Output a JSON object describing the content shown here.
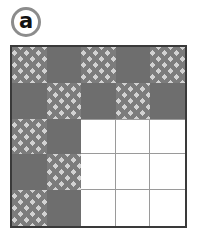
{
  "panel": {
    "label": "a",
    "label_icon": "circled-letter-badge"
  },
  "colors": {
    "solid_tile": "#6e6e6e",
    "chevron_light": "#d2d2d2",
    "chevron_dark": "#7c7c7c",
    "empty_tile": "#ffffff",
    "frame_border": "#3a3a3a",
    "grid_rule": "#9a9a9a",
    "badge_ring": "#8c8c8c",
    "badge_glyph": "#111111"
  },
  "grid": {
    "rows": 5,
    "cols": 5,
    "cells": [
      [
        "chevron",
        "solid",
        "chevron",
        "solid",
        "chevron"
      ],
      [
        "solid",
        "chevron",
        "solid",
        "chevron",
        "solid"
      ],
      [
        "chevron",
        "solid",
        "empty",
        "empty",
        "empty"
      ],
      [
        "solid",
        "chevron",
        "empty",
        "empty",
        "empty"
      ],
      [
        "chevron",
        "solid",
        "empty",
        "empty",
        "empty"
      ]
    ]
  }
}
